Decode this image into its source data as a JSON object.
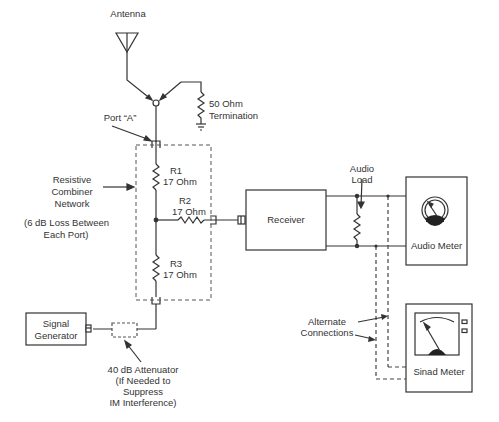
{
  "diagram": {
    "type": "block-schematic",
    "labels": {
      "antenna": "Antenna",
      "termination": "50 Ohm\nTermination",
      "port_a": "Port “A”",
      "combiner": "Resistive\nCombiner\nNetwork",
      "loss_note": "(6 dB Loss Between\nEach Port)",
      "r1_name": "R1",
      "r1_value": "17 Ohm",
      "r2_name": "R2",
      "r2_value": "17 Ohm",
      "r3_name": "R3",
      "r3_value": "17 Ohm",
      "signal_generator": "Signal\nGenerator",
      "attenuator": "40 dB Attenuator\n(If Needed to\nSuppress\nIM Interference)",
      "receiver": "Receiver",
      "audio_load": "Audio\nLoad",
      "audio_meter": "Audio Meter",
      "alternate_connections": "Alternate\nConnections",
      "sinad_meter": "Sinad Meter"
    },
    "colors": {
      "line": "#333333",
      "dashed": "#555555",
      "background": "#ffffff"
    }
  }
}
